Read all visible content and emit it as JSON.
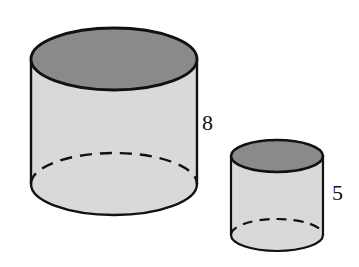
{
  "figure": {
    "background_color": "#ffffff",
    "outline_color": "#111111",
    "top_face_color": "#8a8a8a",
    "body_color": "#d9d9d9",
    "hidden_edge_style": "dashed"
  },
  "shapes": {
    "large_cylinder": {
      "name": "large-cylinder",
      "shape": "cylinder",
      "height_label": "8",
      "center_x": 114,
      "radius_x": 83,
      "radius_y": 31,
      "top_center_y": 59,
      "bottom_center_y": 184
    },
    "small_cylinder": {
      "name": "small-cylinder",
      "shape": "cylinder",
      "height_label": "5",
      "center_x": 277,
      "radius_x": 46,
      "radius_y": 16,
      "top_center_y": 156,
      "bottom_center_y": 235
    }
  },
  "labels": {
    "large_height": "8",
    "small_height": "5"
  },
  "chart_data": {
    "type": "diagram",
    "items": [
      {
        "name": "large cylinder",
        "height": 8
      },
      {
        "name": "small cylinder",
        "height": 5
      }
    ],
    "units": "",
    "annotations": [
      "8",
      "5"
    ]
  }
}
